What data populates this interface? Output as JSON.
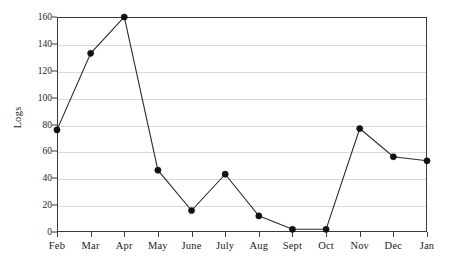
{
  "chart_data": {
    "type": "line",
    "title": "",
    "xlabel": "",
    "ylabel": "Logs",
    "categories": [
      "Feb",
      "Mar",
      "Apr",
      "May",
      "June",
      "July",
      "Aug",
      "Sept",
      "Oct",
      "Nov",
      "Dec",
      "Jan"
    ],
    "values": [
      76,
      133,
      160,
      46,
      16,
      43,
      12,
      2,
      2,
      77,
      56,
      53
    ],
    "ylim": [
      0,
      160
    ],
    "yticks": [
      0,
      20,
      40,
      60,
      80,
      100,
      120,
      140,
      160
    ],
    "ytick_labels": [
      "0",
      "20",
      "40",
      "60",
      "80",
      "100",
      "120",
      "140",
      "160"
    ],
    "grid": true,
    "legend": "none",
    "marker": "filled-circle",
    "line_color": "#2b2b2b",
    "marker_color": "#111111",
    "grid_color": "#d9d9d9",
    "axis_color": "#3a3a3a",
    "background": "#ffffff"
  }
}
